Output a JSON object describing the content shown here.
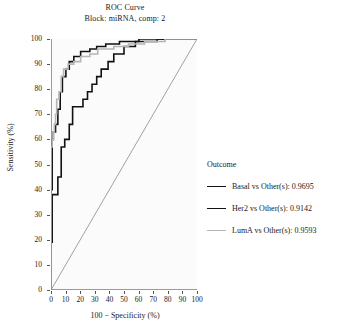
{
  "chart_data": {
    "type": "line",
    "title": "ROC Curve",
    "subtitle": "Block: miRNA, comp: 2",
    "xlabel": "100 − Specificity (%)",
    "ylabel": "Sensitivity (%)",
    "xlim": [
      0,
      100
    ],
    "ylim": [
      0,
      100
    ],
    "xticks": [
      "0",
      "10",
      "20",
      "30",
      "40",
      "50",
      "60",
      "70",
      "80",
      "90",
      "100"
    ],
    "yticks": [
      "0",
      "10",
      "20",
      "30",
      "40",
      "50",
      "60",
      "70",
      "80",
      "90",
      "100"
    ],
    "grid": false,
    "legend_position": "right",
    "legend_title": "Outcome",
    "diagonal_reference_line": true,
    "series": [
      {
        "name": "Basal vs Other(s)",
        "auc": "0.9695",
        "label": "Basal vs Other(s): 0.9695",
        "color": "#111111",
        "width": 1.6,
        "points": [
          [
            0,
            0
          ],
          [
            0,
            40
          ],
          [
            0.8,
            40
          ],
          [
            0.8,
            60
          ],
          [
            1.6,
            60
          ],
          [
            1.6,
            63
          ],
          [
            3.1,
            63
          ],
          [
            3.1,
            66
          ],
          [
            4.7,
            66
          ],
          [
            4.7,
            72
          ],
          [
            6.3,
            72
          ],
          [
            6.3,
            79
          ],
          [
            7.8,
            79
          ],
          [
            7.8,
            85
          ],
          [
            10.2,
            85
          ],
          [
            10.2,
            88
          ],
          [
            12.5,
            88
          ],
          [
            12.5,
            91
          ],
          [
            15.6,
            91
          ],
          [
            15.6,
            93
          ],
          [
            20.3,
            93
          ],
          [
            20.3,
            95
          ],
          [
            26.6,
            95
          ],
          [
            26.6,
            96
          ],
          [
            31.3,
            96
          ],
          [
            31.3,
            97
          ],
          [
            37.5,
            97
          ],
          [
            37.5,
            98
          ],
          [
            46.9,
            98
          ],
          [
            46.9,
            99
          ],
          [
            60.2,
            99
          ],
          [
            60.2,
            100
          ],
          [
            100,
            100
          ]
        ]
      },
      {
        "name": "Her2 vs Other(s)",
        "auc": "0.9142",
        "label": "Her2 vs Other(s): 0.9142",
        "color": "#111111",
        "width": 1.6,
        "points": [
          [
            0,
            0
          ],
          [
            0,
            19
          ],
          [
            0.8,
            19
          ],
          [
            0.8,
            38
          ],
          [
            4.7,
            38
          ],
          [
            4.7,
            45
          ],
          [
            7.0,
            45
          ],
          [
            7.0,
            57
          ],
          [
            9.4,
            57
          ],
          [
            9.4,
            60
          ],
          [
            12.5,
            60
          ],
          [
            12.5,
            66
          ],
          [
            14.8,
            66
          ],
          [
            14.8,
            73
          ],
          [
            21.9,
            73
          ],
          [
            21.9,
            76
          ],
          [
            25.0,
            76
          ],
          [
            25.0,
            79
          ],
          [
            28.1,
            79
          ],
          [
            28.1,
            82
          ],
          [
            31.3,
            82
          ],
          [
            31.3,
            85
          ],
          [
            34.4,
            85
          ],
          [
            34.4,
            88
          ],
          [
            39.1,
            88
          ],
          [
            39.1,
            91
          ],
          [
            43.0,
            91
          ],
          [
            43.0,
            94
          ],
          [
            50.0,
            94
          ],
          [
            50.0,
            97
          ],
          [
            57.8,
            97
          ],
          [
            57.8,
            99
          ],
          [
            72.7,
            99
          ],
          [
            72.7,
            100
          ],
          [
            100,
            100
          ]
        ]
      },
      {
        "name": "LumA vs Other(s)",
        "auc": "0.9593",
        "label": "LumA vs Other(s): 0.9593",
        "color": "#b5b5b5",
        "width": 1.6,
        "points": [
          [
            0,
            0
          ],
          [
            0,
            57
          ],
          [
            0.8,
            57
          ],
          [
            0.8,
            60
          ],
          [
            1.6,
            60
          ],
          [
            1.6,
            63
          ],
          [
            2.3,
            63
          ],
          [
            2.3,
            66
          ],
          [
            3.1,
            66
          ],
          [
            3.1,
            70
          ],
          [
            3.9,
            70
          ],
          [
            3.9,
            76
          ],
          [
            5.5,
            76
          ],
          [
            5.5,
            79
          ],
          [
            7.0,
            79
          ],
          [
            7.0,
            85
          ],
          [
            8.6,
            85
          ],
          [
            8.6,
            88
          ],
          [
            11.7,
            88
          ],
          [
            11.7,
            90
          ],
          [
            15.6,
            90
          ],
          [
            15.6,
            91
          ],
          [
            20.3,
            91
          ],
          [
            20.3,
            93
          ],
          [
            26.6,
            93
          ],
          [
            26.6,
            94
          ],
          [
            32.0,
            94
          ],
          [
            32.0,
            96
          ],
          [
            43.0,
            96
          ],
          [
            43.0,
            97
          ],
          [
            53.1,
            97
          ],
          [
            53.1,
            98
          ],
          [
            64.1,
            98
          ],
          [
            64.1,
            99
          ],
          [
            78.1,
            99
          ],
          [
            78.1,
            100
          ],
          [
            100,
            100
          ]
        ]
      }
    ]
  },
  "style": {
    "plot_background": "#fbfbfb",
    "axis_color": "#9a9a9a",
    "diagonal_color": "#8a8a8a",
    "text_color": "#1a1a1a"
  }
}
